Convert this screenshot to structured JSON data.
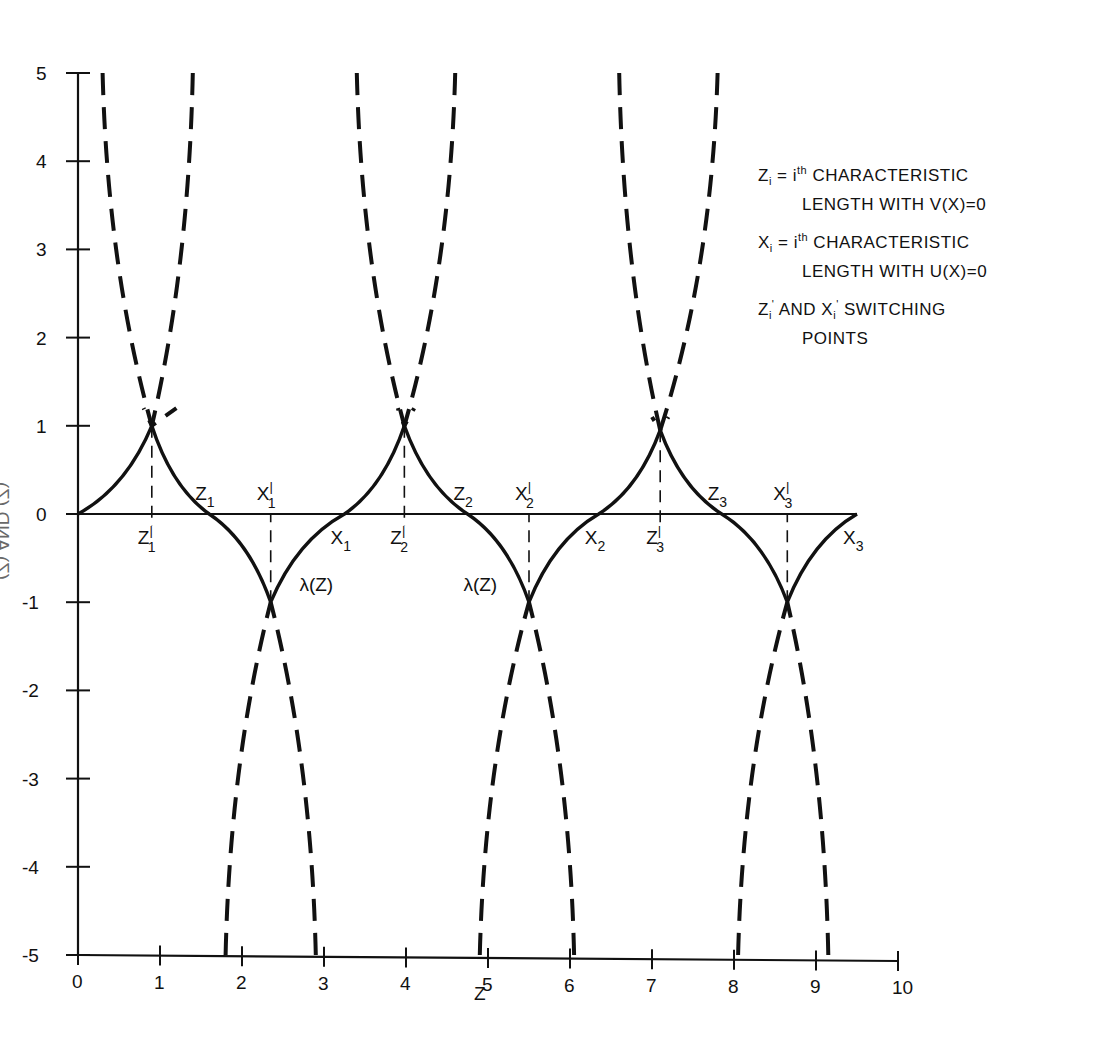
{
  "chart_data": {
    "type": "line",
    "title": "",
    "xlabel": "Z",
    "ylabel": "(Z) AND (Z)",
    "xlim": [
      0,
      10
    ],
    "ylim": [
      -5,
      5
    ],
    "x_ticks": [
      "0",
      "1",
      "2",
      "3",
      "4",
      "5",
      "6",
      "7",
      "8",
      "9",
      "10"
    ],
    "y_ticks": [
      "5",
      "4",
      "3",
      "2",
      "1",
      "0",
      "-1",
      "-2",
      "-3",
      "-4",
      "-5"
    ],
    "grid": false,
    "series": [
      {
        "name": "solid switching trajectory",
        "style": "solid",
        "points": [
          [
            0,
            0
          ],
          [
            0.9,
            1.0
          ],
          [
            1.6,
            0
          ],
          [
            2.35,
            -1.0
          ],
          [
            3.25,
            0
          ],
          [
            3.98,
            1.0
          ],
          [
            4.75,
            0
          ],
          [
            5.5,
            -1.0
          ],
          [
            6.35,
            0
          ],
          [
            7.1,
            0.95
          ],
          [
            7.85,
            0
          ],
          [
            8.65,
            -1.0
          ],
          [
            9.5,
            0
          ]
        ]
      },
      {
        "name": "dashed branches (upper)",
        "style": "dashed",
        "branches": [
          [
            [
              0.3,
              5
            ],
            [
              0.9,
              1.0
            ],
            [
              1.2,
              1.2
            ]
          ],
          [
            [
              1.4,
              5
            ],
            [
              0.9,
              1.0
            ],
            [
              0.8,
              1.2
            ]
          ],
          [
            [
              3.4,
              5
            ],
            [
              3.98,
              1.0
            ],
            [
              4.1,
              1.2
            ]
          ],
          [
            [
              4.6,
              5
            ],
            [
              3.98,
              1.0
            ],
            [
              3.9,
              1.2
            ]
          ],
          [
            [
              6.6,
              5
            ],
            [
              7.1,
              0.95
            ],
            [
              7.2,
              1.1
            ]
          ],
          [
            [
              7.8,
              5
            ],
            [
              7.1,
              0.95
            ],
            [
              7.0,
              1.1
            ]
          ]
        ]
      },
      {
        "name": "dashed branches (lower)",
        "style": "dashed",
        "branches": [
          [
            [
              1.8,
              -5
            ],
            [
              2.35,
              -1.0
            ]
          ],
          [
            [
              2.9,
              -5
            ],
            [
              2.35,
              -1.0
            ]
          ],
          [
            [
              4.9,
              -5
            ],
            [
              5.5,
              -1.0
            ]
          ],
          [
            [
              6.05,
              -5
            ],
            [
              5.5,
              -1.0
            ]
          ],
          [
            [
              8.05,
              -5
            ],
            [
              8.65,
              -1.0
            ]
          ],
          [
            [
              9.15,
              -5
            ],
            [
              8.65,
              -1.0
            ]
          ]
        ]
      }
    ],
    "annotations": [
      {
        "text": "Z1'",
        "x": 0.9,
        "y": -0.25
      },
      {
        "text": "Z1",
        "x": 1.6,
        "y": 0.25
      },
      {
        "text": "X1'",
        "x": 2.35,
        "y": 0.25
      },
      {
        "text": "X1",
        "x": 3.25,
        "y": -0.25
      },
      {
        "text": "Z2'",
        "x": 3.98,
        "y": -0.25
      },
      {
        "text": "Z2",
        "x": 4.75,
        "y": 0.25
      },
      {
        "text": "X2'",
        "x": 5.5,
        "y": 0.25
      },
      {
        "text": "X2",
        "x": 6.35,
        "y": -0.25
      },
      {
        "text": "Z3'",
        "x": 7.1,
        "y": -0.25
      },
      {
        "text": "Z3",
        "x": 7.85,
        "y": 0.25
      },
      {
        "text": "X3'",
        "x": 8.65,
        "y": 0.25
      },
      {
        "text": "X3",
        "x": 9.5,
        "y": -0.25
      },
      {
        "text": "λ(Z)",
        "x": 2.7,
        "y": -0.8
      },
      {
        "text": "λ(Z)",
        "x": 4.7,
        "y": -0.8
      }
    ],
    "legend": [
      {
        "line1": "Zi = i th CHARACTERISTIC",
        "line2": "LENGTH WITH V(X)=0"
      },
      {
        "line1": "Xi = i th CHARACTERISTIC",
        "line2": "LENGTH WITH U(X)=0"
      },
      {
        "line1": "Zi' AND Xi' SWITCHING",
        "line2": "POINTS"
      }
    ],
    "legend_position": "upper right"
  },
  "labels": {
    "xlabel": "Z",
    "ylabel": "(Z) AND (Z)",
    "lambda": "λ(Z)",
    "legend": {
      "e1_sym": "Z",
      "e1_sub": "i",
      "e1_eq": " = i",
      "e1_sup": "th",
      "e1_rest": " CHARACTERISTIC",
      "e1_l2": "LENGTH WITH V(X)=0",
      "e2_sym": "X",
      "e2_sub": "i",
      "e2_eq": " = i",
      "e2_sup": "th",
      "e2_rest": " CHARACTERISTIC",
      "e2_l2": "LENGTH WITH U(X)=0",
      "e3_a": "Z",
      "e3_a_sub": "i",
      "e3_a_sup": "'",
      "e3_mid": " AND X",
      "e3_b_sub": "i",
      "e3_b_sup": "'",
      "e3_rest": " SWITCHING",
      "e3_l2": "POINTS"
    },
    "points": {
      "z1p": "Z",
      "z1": "Z",
      "x1p": "X",
      "x1": "X",
      "z2p": "Z",
      "z2": "Z",
      "x2p": "X",
      "x2": "X",
      "z3p": "Z",
      "z3": "Z",
      "x3p": "X",
      "x3": "X",
      "s1": "1",
      "s2": "2",
      "s3": "3",
      "prime": "'"
    }
  }
}
